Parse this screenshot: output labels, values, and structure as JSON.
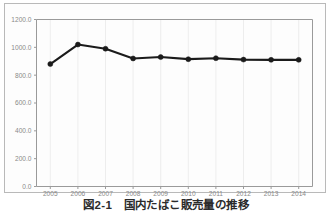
{
  "caption": {
    "text": "図2-1　国内たばこ販売量の推移"
  },
  "chart_data": {
    "type": "line",
    "title": "",
    "subtitle": "",
    "xlabel": "",
    "ylabel": "",
    "categories": [
      "2005",
      "2006",
      "2007",
      "2008",
      "2009",
      "2010",
      "2011",
      "2012",
      "2013",
      "2014"
    ],
    "x": [
      2005,
      2006,
      2007,
      2008,
      2009,
      2010,
      2011,
      2012,
      2013,
      2014
    ],
    "values": [
      880.0,
      1020.0,
      990.0,
      920.0,
      930.0,
      915.0,
      922.0,
      912.0,
      910.0,
      910.0
    ],
    "series": [
      {
        "name": "",
        "color": "#1b1b1b",
        "marker": "circle",
        "values": [
          880.0,
          1020.0,
          990.0,
          920.0,
          930.0,
          915.0,
          922.0,
          912.0,
          910.0,
          910.0
        ]
      }
    ],
    "ylim": [
      0.0,
      1200.0
    ],
    "yticks": [
      0.0,
      200.0,
      400.0,
      600.0,
      800.0,
      1000.0,
      1200.0
    ],
    "ytick_labels": [
      "0.0",
      "200.0",
      "400.0",
      "600.0",
      "800.0",
      "1000.0",
      "1200.0"
    ],
    "xtick_labels": [
      "2005",
      "2006",
      "2007",
      "2008",
      "2009",
      "2010",
      "2011",
      "2012",
      "2013",
      "2014"
    ],
    "grid": true,
    "legend": false,
    "legend_position": "none",
    "axis_color": "#9a9a9a",
    "tick_label_color": "#8a8a8a",
    "grid_color": "#e2e2e2"
  }
}
